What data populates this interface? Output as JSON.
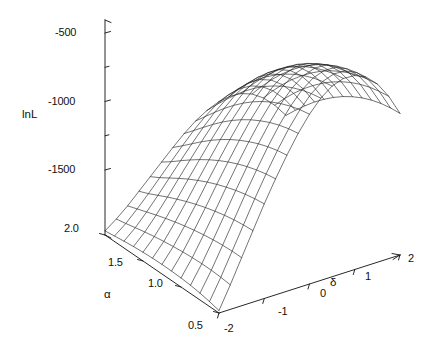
{
  "figure": {
    "kind": "3d-wireframe-surface",
    "background": "#ffffff",
    "line_color": "#1a1a1a"
  },
  "chart_data": {
    "type": "line",
    "subtype": "surface-wireframe-3d",
    "title": "",
    "zlabel": "lnL",
    "xlabel": "α",
    "ylabel": "δ",
    "grid": false,
    "legend_position": "none",
    "zlim": [
      -1750,
      -350
    ],
    "z_ticks": [
      -500,
      -1000,
      -1500
    ],
    "z_tick_labels": [
      "-500",
      "-1000",
      "-1500"
    ],
    "xlim": [
      0.5,
      2.0
    ],
    "x_ticks": [
      2.0,
      1.5,
      1.0,
      0.5
    ],
    "x_tick_labels": [
      "2.0",
      "1.5",
      "1.0",
      "0.5"
    ],
    "ylim": [
      -2,
      2
    ],
    "y_ticks": [
      -2,
      -1,
      0,
      1,
      2
    ],
    "y_tick_labels": [
      "-2",
      "-1",
      "0",
      "1",
      "2"
    ],
    "x_name": "α",
    "y_name": "δ",
    "z_name": "lnL",
    "alpha_grid": [
      2.0,
      1.875,
      1.75,
      1.625,
      1.5,
      1.375,
      1.25,
      1.125,
      1.0,
      0.875,
      0.75,
      0.625,
      0.5
    ],
    "delta_grid": [
      -2.0,
      -1.75,
      -1.5,
      -1.25,
      -1.0,
      -0.75,
      -0.5,
      -0.25,
      0.0,
      0.25,
      0.5,
      0.75,
      1.0,
      1.25,
      1.5,
      1.75,
      2.0
    ],
    "z_surface": [
      [
        -1720,
        -1660,
        -1590,
        -1510,
        -1430,
        -1350,
        -1270,
        -1195,
        -1130,
        -1080,
        -1045,
        -1030,
        -1035,
        -1065,
        -1120,
        -1200,
        -1300
      ],
      [
        -1710,
        -1645,
        -1565,
        -1480,
        -1390,
        -1300,
        -1210,
        -1125,
        -1050,
        -990,
        -948,
        -928,
        -932,
        -962,
        -1020,
        -1105,
        -1215
      ],
      [
        -1700,
        -1628,
        -1540,
        -1445,
        -1345,
        -1245,
        -1148,
        -1055,
        -972,
        -905,
        -858,
        -835,
        -838,
        -868,
        -928,
        -1018,
        -1135
      ],
      [
        -1692,
        -1612,
        -1515,
        -1410,
        -1300,
        -1192,
        -1086,
        -986,
        -896,
        -823,
        -772,
        -747,
        -750,
        -781,
        -844,
        -938,
        -1060
      ],
      [
        -1686,
        -1598,
        -1492,
        -1378,
        -1258,
        -1142,
        -1028,
        -921,
        -826,
        -748,
        -694,
        -668,
        -671,
        -703,
        -769,
        -867,
        -993
      ],
      [
        -1682,
        -1586,
        -1471,
        -1348,
        -1220,
        -1096,
        -975,
        -862,
        -762,
        -680,
        -624,
        -597,
        -600,
        -633,
        -701,
        -802,
        -932
      ],
      [
        -1680,
        -1576,
        -1452,
        -1321,
        -1185,
        -1054,
        -927,
        -809,
        -705,
        -620,
        -562,
        -534,
        -537,
        -571,
        -641,
        -745,
        -878
      ],
      [
        -1681,
        -1568,
        -1436,
        -1297,
        -1154,
        -1017,
        -885,
        -762,
        -655,
        -568,
        -508,
        -479,
        -483,
        -518,
        -589,
        -696,
        -832
      ],
      [
        -1684,
        -1562,
        -1422,
        -1276,
        -1127,
        -984,
        -848,
        -722,
        -612,
        -523,
        -462,
        -433,
        -437,
        -473,
        -546,
        -654,
        -793
      ],
      [
        -1690,
        -1559,
        -1411,
        -1258,
        -1103,
        -956,
        -816,
        -687,
        -576,
        -486,
        -424,
        -395,
        -399,
        -436,
        -510,
        -620,
        -762
      ],
      [
        -1700,
        -1559,
        -1403,
        -1244,
        -1084,
        -933,
        -790,
        -659,
        -547,
        -456,
        -394,
        -365,
        -369,
        -407,
        -482,
        -594,
        -739
      ],
      [
        -1714,
        -1563,
        -1399,
        -1234,
        -1069,
        -915,
        -770,
        -638,
        -525,
        -434,
        -372,
        -343,
        -348,
        -386,
        -462,
        -576,
        -724
      ],
      [
        -1732,
        -1571,
        -1399,
        -1228,
        -1059,
        -903,
        -757,
        -624,
        -511,
        -420,
        -358,
        -329,
        -334,
        -372,
        -449,
        -565,
        -716
      ]
    ]
  },
  "axes": {
    "z": {
      "label": "lnL",
      "ticks": [
        {
          "value": -500,
          "text": "-500"
        },
        {
          "value": -1000,
          "text": "-1000"
        },
        {
          "value": -1500,
          "text": "-1500"
        }
      ]
    },
    "alpha": {
      "label": "α",
      "ticks": [
        {
          "value": 2.0,
          "text": "2.0"
        },
        {
          "value": 1.5,
          "text": "1.5"
        },
        {
          "value": 1.0,
          "text": "1.0"
        },
        {
          "value": 0.5,
          "text": "0.5"
        }
      ]
    },
    "delta": {
      "label": "δ",
      "ticks": [
        {
          "value": -2,
          "text": "-2"
        },
        {
          "value": -1,
          "text": "-1"
        },
        {
          "value": 0,
          "text": "0"
        },
        {
          "value": 1,
          "text": "1"
        },
        {
          "value": 2,
          "text": "2"
        }
      ]
    }
  }
}
